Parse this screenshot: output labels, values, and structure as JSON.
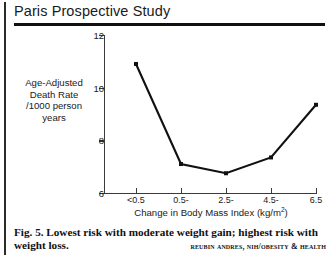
{
  "figure": {
    "title": "Paris Prospective Study",
    "caption_line1": "Fig. 5. Lowest risk with moderate weight gain; highest risk with",
    "caption_line2": "weight loss.",
    "attribution": "Reubin Andres, NIH/Obesity & Health"
  },
  "chart_data": {
    "type": "line",
    "title": "Paris Prospective Study",
    "categories": [
      "<0.5",
      "0.5-",
      "2.5-",
      "4.5-",
      "6.5"
    ],
    "values": [
      10.9,
      7.1,
      6.75,
      7.35,
      9.35
    ],
    "xlabel_main": "Change in Body Mass Index (kg/m",
    "xlabel_sup": "2",
    "xlabel_tail": ")",
    "ylabel_lines": [
      "Age-Adjusted",
      "Death Rate",
      "/1000 person",
      "years"
    ],
    "yticks": [
      6,
      8,
      10,
      12
    ],
    "ylim": [
      6,
      12
    ],
    "grid": false,
    "legend": false,
    "marker": "square",
    "line_color": "#111111"
  }
}
